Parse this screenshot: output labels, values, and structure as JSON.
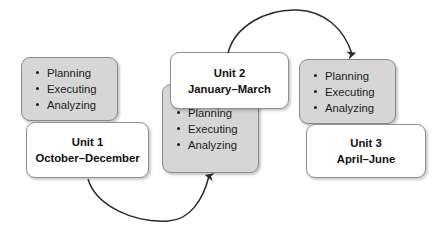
{
  "diagram": {
    "colors": {
      "card_gray_fill": "#d6d6d6",
      "card_white_fill": "#ffffff",
      "card_border": "#8c8c8c",
      "text": "#1c1c1c",
      "arrow": "#2b2b2b",
      "background": "#ffffff"
    },
    "groups": [
      {
        "id": "unit-1",
        "bullets_card": {
          "fill": "gray",
          "items": [
            "Planning",
            "Executing",
            "Analyzing"
          ]
        },
        "title_card": {
          "fill": "white",
          "line1": "Unit 1",
          "line2": "October–December"
        }
      },
      {
        "id": "unit-2",
        "bullets_card": {
          "fill": "gray",
          "items": [
            "Planning",
            "Executing",
            "Analyzing"
          ]
        },
        "title_card": {
          "fill": "white",
          "line1": "Unit 2",
          "line2": "January–March"
        }
      },
      {
        "id": "unit-3",
        "bullets_card": {
          "fill": "gray",
          "items": [
            "Planning",
            "Executing",
            "Analyzing"
          ]
        },
        "title_card": {
          "fill": "white",
          "line1": "Unit 3",
          "line2": "April–June"
        }
      }
    ],
    "arrows": [
      {
        "id": "arrow-unit1-to-unit2",
        "from": "unit-1",
        "to": "unit-2",
        "direction": "clockwise-below",
        "label": ""
      },
      {
        "id": "arrow-unit2-to-unit3",
        "from": "unit-2",
        "to": "unit-3",
        "direction": "clockwise-above",
        "label": ""
      }
    ]
  }
}
